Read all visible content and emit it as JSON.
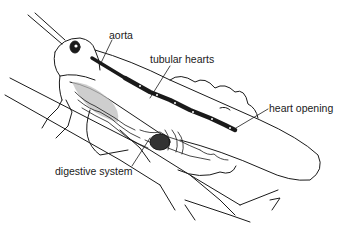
{
  "diagram": {
    "labels": [
      {
        "id": "aorta",
        "text": "aorta",
        "x": 109,
        "y": 34
      },
      {
        "id": "tubular-hearts",
        "text": "tubular hearts",
        "x": 150,
        "y": 57
      },
      {
        "id": "heart-opening",
        "text": "heart opening",
        "x": 269,
        "y": 106
      },
      {
        "id": "digestive-system",
        "text": "digestive system",
        "x": 55,
        "y": 170
      }
    ],
    "colors": {
      "ink": "#1a1a1a",
      "background": "#ffffff",
      "shading": "#9a9a9a"
    }
  }
}
